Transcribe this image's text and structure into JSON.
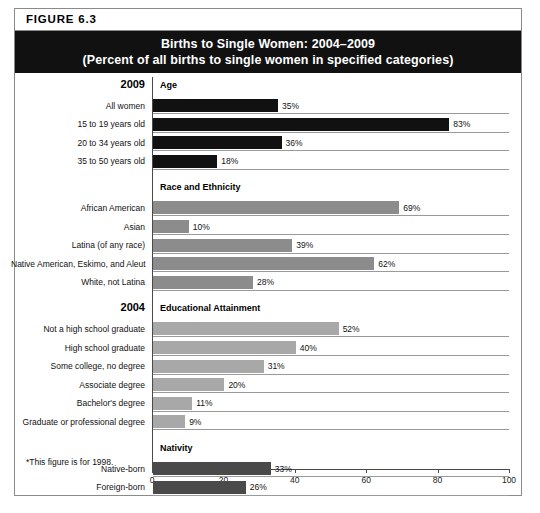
{
  "figure": {
    "label": "FIGURE  6.3",
    "title_line1": "Births to Single Women: 2004–2009",
    "title_line2": "(Percent of all births to single women in specified categories)",
    "footnote": "*This figure is for 1998."
  },
  "colors": {
    "banner_background": "#111111",
    "banner_text": "#ffffff",
    "bar_age": "#111111",
    "bar_race": "#8c8c8c",
    "bar_education": "#a8a8a8",
    "bar_nativity": "#4a4a4a",
    "axis": "#4a4a4a",
    "gridline": "#9a9a9a",
    "border": "#8a8a8a"
  },
  "chart_data": {
    "type": "bar",
    "orientation": "horizontal",
    "title": "Births to Single Women: 2004–2009",
    "subtitle": "(Percent of all births to single women in specified categories)",
    "xlabel": "",
    "ylabel": "",
    "xlim": [
      0,
      100
    ],
    "xticks": [
      0,
      20,
      40,
      60,
      80,
      100
    ],
    "xtick_labels": [
      "0",
      "20",
      "40",
      "60",
      "80",
      "100"
    ],
    "grid": false,
    "value_suffix": "%",
    "legend": "none",
    "groups": [
      {
        "year": "2009",
        "section": "Age",
        "color": "#111111",
        "categories": [
          "All women",
          "15 to 19 years old",
          "20 to 34 years old",
          "35 to 50 years old"
        ],
        "values": [
          35,
          83,
          36,
          18
        ],
        "value_labels": [
          "35%",
          "83%",
          "36%",
          "18%"
        ]
      },
      {
        "year": "",
        "section": "Race and Ethnicity",
        "color": "#8c8c8c",
        "categories": [
          "African American",
          "Asian",
          "Latina (of any race)",
          "Native American, Eskimo, and Aleut",
          "White, not Latina"
        ],
        "values": [
          69,
          10,
          39,
          62,
          28
        ],
        "value_labels": [
          "69%",
          "10%",
          "39%",
          "62%",
          "28%"
        ]
      },
      {
        "year": "2004",
        "section": "Educational Attainment",
        "color": "#a8a8a8",
        "categories": [
          "Not a high school graduate",
          "High school graduate",
          "Some college, no degree",
          "Associate degree",
          "Bachelor's degree",
          "Graduate or professional degree"
        ],
        "values": [
          52,
          40,
          31,
          20,
          11,
          9
        ],
        "value_labels": [
          "52%",
          "40%",
          "31%",
          "20%",
          "11%",
          "9%"
        ]
      },
      {
        "year": "",
        "section": "Nativity",
        "color": "#4a4a4a",
        "categories": [
          "Native-born",
          "Foreign-born"
        ],
        "values": [
          33,
          26
        ],
        "value_labels": [
          "33%",
          "26%"
        ]
      }
    ]
  }
}
